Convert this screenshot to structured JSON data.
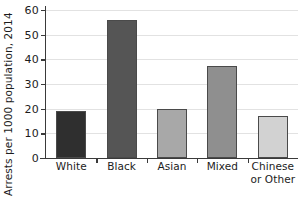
{
  "chart_data": {
    "type": "bar",
    "title": "",
    "xlabel": "",
    "ylabel": "Arrests per 1000 population, 2014",
    "categories": [
      "White",
      "Black",
      "Asian",
      "Mixed",
      "Chinese or Other"
    ],
    "category_lines": [
      [
        "White"
      ],
      [
        "Black"
      ],
      [
        "Asian"
      ],
      [
        "Mixed"
      ],
      [
        "Chinese",
        "or Other"
      ]
    ],
    "values": [
      19,
      56,
      19.8,
      37.5,
      17
    ],
    "bar_colors": [
      "#2f2f2f",
      "#555555",
      "#a8a8a8",
      "#8f8f8f",
      "#d2d2d2"
    ],
    "bar_outline_color": "#4a4a4a",
    "ylim": [
      0,
      60
    ],
    "yticks": [
      0,
      10,
      20,
      30,
      40,
      50,
      60
    ],
    "ytick_labels": [
      "0",
      "10",
      "20",
      "30",
      "40",
      "50",
      "60"
    ],
    "grid": true,
    "grid_axis": "y",
    "grid_color": "#e2e2e2",
    "legend": "none",
    "background_color": "#ffffff",
    "axis_color": "#3a3a3a"
  },
  "axes": {
    "y_title": "Arrests per 1000 population, 2014"
  },
  "cropped_title_fragment": ""
}
